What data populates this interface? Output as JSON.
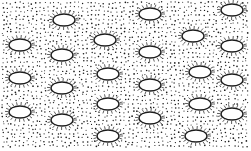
{
  "image": {
    "description": "Black-and-white stippled pattern of horizontal ellipses with hatched lash marks on a dotted background",
    "width": 251,
    "height": 151,
    "colors": {
      "background": "#ffffff",
      "ink": "#1a1a1a"
    },
    "ellipse_size": {
      "rx": 11,
      "ry": 6
    },
    "ellipses": [
      {
        "cx": 64,
        "cy": 20
      },
      {
        "cx": 105,
        "cy": 40
      },
      {
        "cx": 150,
        "cy": 14
      },
      {
        "cx": 193,
        "cy": 36
      },
      {
        "cx": 232,
        "cy": 10
      },
      {
        "cx": 20,
        "cy": 45
      },
      {
        "cx": 62,
        "cy": 55
      },
      {
        "cx": 108,
        "cy": 74
      },
      {
        "cx": 150,
        "cy": 52
      },
      {
        "cx": 200,
        "cy": 72
      },
      {
        "cx": 232,
        "cy": 46
      },
      {
        "cx": 20,
        "cy": 78
      },
      {
        "cx": 62,
        "cy": 88
      },
      {
        "cx": 108,
        "cy": 104
      },
      {
        "cx": 150,
        "cy": 85
      },
      {
        "cx": 200,
        "cy": 104
      },
      {
        "cx": 232,
        "cy": 80
      },
      {
        "cx": 20,
        "cy": 112
      },
      {
        "cx": 62,
        "cy": 120
      },
      {
        "cx": 108,
        "cy": 136
      },
      {
        "cx": 150,
        "cy": 118
      },
      {
        "cx": 196,
        "cy": 136
      },
      {
        "cx": 232,
        "cy": 114
      }
    ]
  }
}
